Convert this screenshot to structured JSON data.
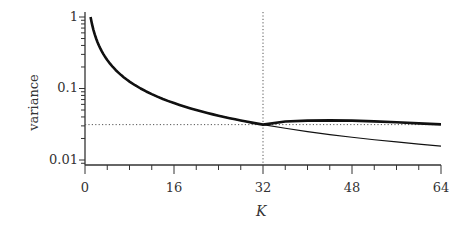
{
  "chart_data": {
    "type": "line",
    "title": "",
    "xlabel": "K",
    "ylabel": "variance",
    "xlim": [
      0,
      64
    ],
    "ylim": [
      0.008,
      1.1
    ],
    "yscale": "log",
    "xticks": [
      "0",
      "16",
      "32",
      "48",
      "64"
    ],
    "yticks": [
      "1",
      "0.1",
      "0.01"
    ],
    "grid": false,
    "legend": null,
    "reference_lines": {
      "vertical_x": 32,
      "horizontal_y": 0.03125,
      "style": "dotted"
    },
    "series": [
      {
        "name": "thick",
        "style": "thick",
        "x": [
          1,
          2,
          3,
          4,
          6,
          8,
          12,
          16,
          20,
          24,
          28,
          32,
          36,
          40,
          44,
          48,
          52,
          56,
          60,
          64
        ],
        "values": [
          1.0,
          0.5,
          0.333,
          0.25,
          0.167,
          0.125,
          0.0833,
          0.0625,
          0.05,
          0.0417,
          0.0357,
          0.03125,
          0.0345,
          0.0355,
          0.0358,
          0.0355,
          0.0347,
          0.0337,
          0.0325,
          0.0315
        ]
      },
      {
        "name": "thin",
        "style": "thin",
        "x": [
          1,
          2,
          3,
          4,
          6,
          8,
          12,
          16,
          20,
          24,
          28,
          32,
          36,
          40,
          44,
          48,
          52,
          56,
          60,
          64
        ],
        "values": [
          1.0,
          0.5,
          0.333,
          0.25,
          0.167,
          0.125,
          0.0833,
          0.0625,
          0.05,
          0.0417,
          0.0357,
          0.03125,
          0.0278,
          0.025,
          0.0227,
          0.0208,
          0.0192,
          0.0179,
          0.0167,
          0.0156
        ]
      }
    ]
  },
  "axes": {
    "xlabel": "K",
    "ylabel": "variance",
    "xticks": [
      "0",
      "16",
      "32",
      "48",
      "64"
    ],
    "yticks": [
      "1",
      "0.1",
      "0.01"
    ]
  }
}
